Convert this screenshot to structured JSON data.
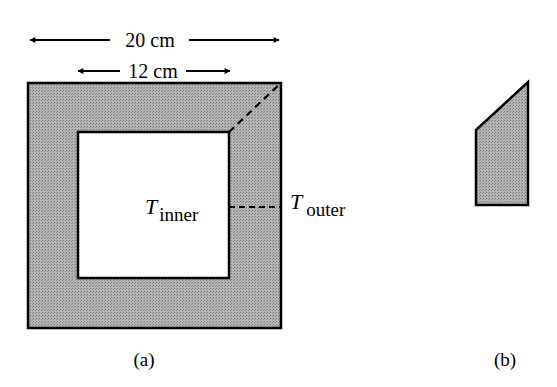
{
  "figure": {
    "panel_a": {
      "caption": "(a)",
      "dimension_outer": "20 cm",
      "dimension_inner": "12 cm",
      "label_inner": {
        "symbol": "T",
        "subscript": "inner"
      },
      "label_outer": {
        "symbol": "T",
        "subscript": "outer"
      }
    },
    "panel_b": {
      "caption": "(b)"
    },
    "colors": {
      "fill": "#a6a6a6",
      "stroke": "#000000",
      "background": "#ffffff"
    }
  }
}
